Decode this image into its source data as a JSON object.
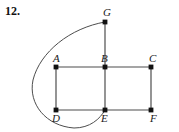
{
  "problem": {
    "number_label": "12."
  },
  "figure": {
    "type": "graph-diagram",
    "background_color": "#ffffff",
    "stroke_color": "#4d4d4d",
    "vertex_color": "#111111",
    "vertex_radius": 2.4,
    "edge_width": 1.2,
    "curve_width": 1.0,
    "vertices": [
      {
        "id": "G",
        "label": "G",
        "x": 105,
        "y": 22,
        "label_x": 103,
        "label_y": 16
      },
      {
        "id": "A",
        "label": "A",
        "x": 56,
        "y": 67,
        "label_x": 53,
        "label_y": 62
      },
      {
        "id": "B",
        "label": "B",
        "x": 105,
        "y": 67,
        "label_x": 101,
        "label_y": 62
      },
      {
        "id": "C",
        "label": "C",
        "x": 151,
        "y": 67,
        "label_x": 149,
        "label_y": 62
      },
      {
        "id": "D",
        "label": "D",
        "x": 56,
        "y": 110,
        "label_x": 52,
        "label_y": 122
      },
      {
        "id": "E",
        "label": "E",
        "x": 105,
        "y": 110,
        "label_x": 101,
        "label_y": 122
      },
      {
        "id": "F",
        "label": "F",
        "x": 151,
        "y": 110,
        "label_x": 150,
        "label_y": 122
      }
    ],
    "straight_edges": [
      {
        "id": "edge-GB",
        "from": "G",
        "to": "B"
      },
      {
        "id": "edge-AB",
        "from": "A",
        "to": "B"
      },
      {
        "id": "edge-BC",
        "from": "B",
        "to": "C"
      },
      {
        "id": "edge-AD",
        "from": "A",
        "to": "D"
      },
      {
        "id": "edge-BE",
        "from": "B",
        "to": "E"
      },
      {
        "id": "edge-CF",
        "from": "C",
        "to": "F"
      },
      {
        "id": "edge-DE",
        "from": "D",
        "to": "E"
      },
      {
        "id": "edge-EF",
        "from": "E",
        "to": "F"
      }
    ],
    "curved_edges": [
      {
        "id": "edge-GE-curve",
        "from": "G",
        "to": "E",
        "path": "M 105 22 C 70 28, 40 52, 33 80 C 28 104, 46 126, 74 128 C 90 128, 100 119, 105 110"
      }
    ]
  }
}
